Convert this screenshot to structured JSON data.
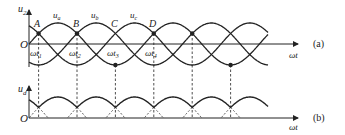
{
  "figure": {
    "panel_a": {
      "y_axis_label": "u",
      "y_axis_sub": "2",
      "origin_label": "O",
      "x_axis_label": "ωt",
      "panel_tag": "(a)",
      "curve_labels": [
        {
          "main": "u",
          "sub": "a"
        },
        {
          "main": "u",
          "sub": "b"
        },
        {
          "main": "u",
          "sub": "c"
        }
      ],
      "points": [
        "A",
        "B",
        "C",
        "D"
      ],
      "time_labels": [
        {
          "main": "ωt",
          "sub": "1"
        },
        {
          "main": "ωt",
          "sub": "2"
        },
        {
          "main": "ωt",
          "sub": "3"
        },
        {
          "main": "ωt",
          "sub": "4"
        }
      ]
    },
    "panel_b": {
      "y_axis_label": "u",
      "y_axis_sub": "d",
      "origin_label": "O",
      "x_axis_label": "ωt",
      "panel_tag": "(b)"
    },
    "colors": {
      "line": "#222222",
      "background": "#ffffff"
    }
  }
}
